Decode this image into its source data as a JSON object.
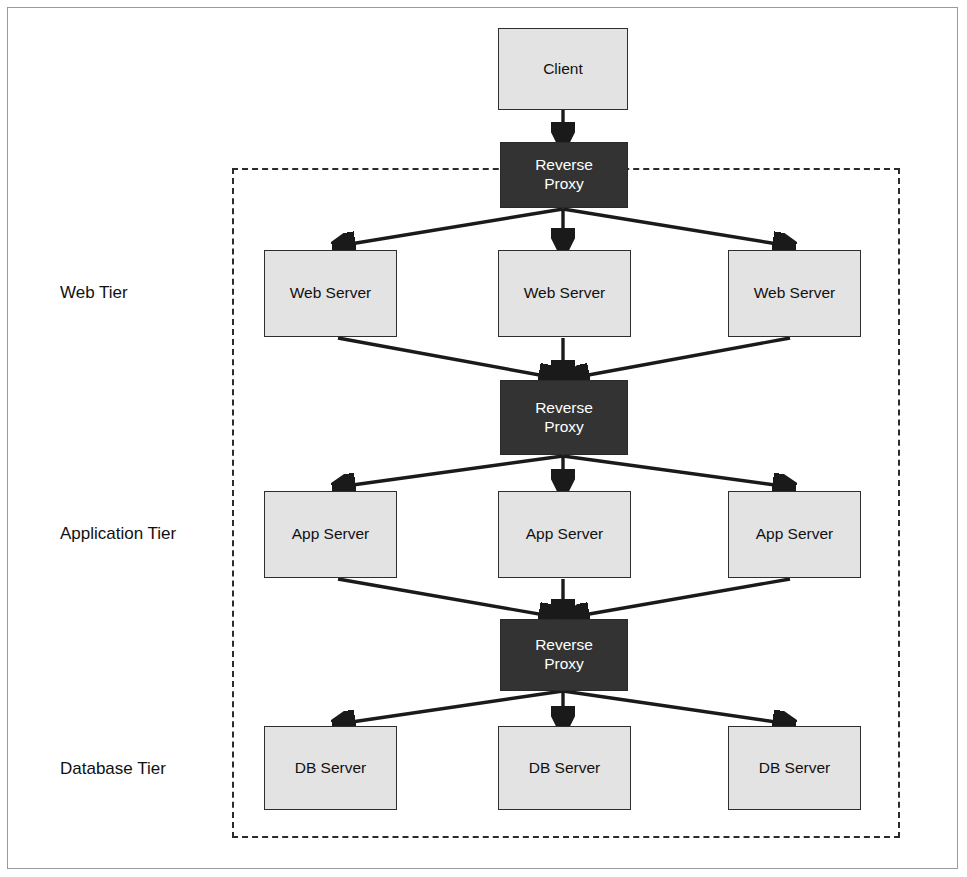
{
  "diagram": {
    "canvas": {
      "width": 967,
      "height": 877
    },
    "colors": {
      "node_fill": "#e3e3e3",
      "node_border": "#2e2e2e",
      "proxy_fill": "#333333",
      "proxy_text": "#ffffff",
      "arrow": "#1a1a1a",
      "dashed_boundary": "#2b2b2b",
      "outer_frame": "#9a9a9a",
      "background": "#ffffff"
    },
    "boundary": {
      "style": "dashed",
      "label": ""
    }
  },
  "tier_labels": [
    {
      "id": "web",
      "text": "Web Tier"
    },
    {
      "id": "application",
      "text": "Application Tier"
    },
    {
      "id": "database",
      "text": "Database Tier"
    }
  ],
  "nodes": {
    "client": {
      "label": "Client",
      "type": "light"
    },
    "proxy_top": {
      "label": "Reverse\nProxy",
      "type": "proxy"
    },
    "proxy_middle": {
      "label": "Reverse\nProxy",
      "type": "proxy"
    },
    "proxy_bottom": {
      "label": "Reverse\nProxy",
      "type": "proxy"
    },
    "web_servers": [
      {
        "label": "Web Server"
      },
      {
        "label": "Web Server"
      },
      {
        "label": "Web Server"
      }
    ],
    "app_servers": [
      {
        "label": "App Server"
      },
      {
        "label": "App Server"
      },
      {
        "label": "App Server"
      }
    ],
    "db_servers": [
      {
        "label": "DB Server"
      },
      {
        "label": "DB Server"
      },
      {
        "label": "DB Server"
      }
    ]
  }
}
